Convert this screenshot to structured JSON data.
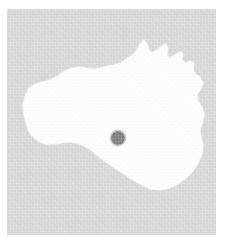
{
  "figure": {
    "name": "island-locator-map",
    "width_px": 228,
    "height_px": 249,
    "title": "",
    "caption": ""
  },
  "colors": {
    "page_background": "#ffffff",
    "water_background": "#d9d9d9",
    "land_fill": "#ffffff",
    "marker_fill": "#7f7f7f"
  },
  "panel": {
    "name": "map-panel",
    "left_px": 7,
    "top_px": 9,
    "width_px": 209,
    "height_px": 226,
    "label": ""
  },
  "land": {
    "name": "landmass",
    "label": "",
    "fill": "#ffffff",
    "outline_path": "M 18 87 L 22 79 L 29 75 L 36 73 L 43 71 L 51 67 L 58 62 L 65 59 L 72 58 L 79 59 L 86 60 L 93 59 L 100 57 L 107 56 L 114 54 L 121 49 L 127 45 L 131 39 L 134 34 L 137 31 L 140 35 L 142 41 L 145 44 L 150 41 L 155 37 L 159 35 L 161 40 L 160 46 L 163 49 L 168 46 L 173 43 L 176 45 L 175 51 L 178 54 L 183 52 L 187 54 L 186 60 L 188 65 L 193 68 L 196 74 L 194 80 L 190 85 L 191 92 L 195 98 L 197 105 L 196 113 L 193 120 L 194 128 L 196 136 L 195 145 L 191 154 L 186 162 L 179 169 L 171 175 L 162 179 L 153 181 L 144 180 L 135 176 L 126 171 L 117 165 L 108 159 L 99 153 L 91 147 L 84 141 L 77 137 L 70 134 L 62 133 L 54 134 L 46 135 L 38 135 L 31 132 L 25 127 L 21 121 L 19 114 L 17 106 L 16 97 Z"
  },
  "marker": {
    "name": "location-marker",
    "label": "",
    "center_x_px": 118,
    "center_y_px": 138,
    "radius_px": 7,
    "fill": "#7f7f7f"
  }
}
